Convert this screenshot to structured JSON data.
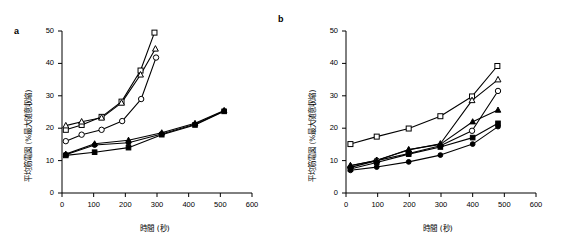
{
  "figure": {
    "panels": [
      {
        "key": "a",
        "label": "a",
        "xlabel": "時間 (秒)",
        "ylabel": "平均筋電図 (%最大随意収縮)"
      },
      {
        "key": "b",
        "label": "b",
        "xlabel": "時間 (秒)",
        "ylabel": "平均筋電図 (%最大随意収縮)"
      }
    ],
    "axis": {
      "xticks": [
        0,
        100,
        200,
        300,
        400,
        500,
        600
      ],
      "yticks": [
        0,
        10,
        20,
        30,
        40,
        50
      ],
      "xlim": [
        0,
        600
      ],
      "ylim": [
        0,
        50
      ]
    },
    "colors": {
      "ink": "#000000",
      "paper": "#ffffff"
    }
  },
  "chart_data": [
    {
      "type": "line",
      "panel": "a",
      "title": "a",
      "xlabel": "時間 (秒)",
      "ylabel": "平均筋電図 (%最大随意収縮)",
      "xlim": [
        0,
        600
      ],
      "ylim": [
        0,
        50
      ],
      "xticks": [
        0,
        100,
        200,
        300,
        400,
        500,
        600
      ],
      "yticks": [
        0,
        10,
        20,
        30,
        40,
        50
      ],
      "grid": false,
      "legend": "none",
      "series": [
        {
          "name": "open-square",
          "marker": "open-square",
          "x": [
            12,
            62,
            125,
            188,
            248,
            292
          ],
          "y": [
            19.5,
            21.0,
            23.5,
            28.2,
            37.8,
            49.5
          ]
        },
        {
          "name": "open-triangle",
          "marker": "open-triangle",
          "x": [
            12,
            62,
            125,
            188,
            248,
            295
          ],
          "y": [
            20.8,
            22.0,
            23.2,
            27.8,
            36.5,
            44.5
          ]
        },
        {
          "name": "open-circle",
          "marker": "open-circle",
          "x": [
            12,
            62,
            125,
            190,
            250,
            297
          ],
          "y": [
            16.0,
            18.0,
            19.5,
            22.2,
            29.0,
            41.8
          ]
        },
        {
          "name": "filled-triangle",
          "marker": "filled-triangle",
          "x": [
            12,
            103,
            210,
            315,
            420,
            512
          ],
          "y": [
            12.0,
            15.2,
            16.3,
            18.6,
            21.5,
            25.5
          ]
        },
        {
          "name": "filled-circle",
          "marker": "filled-circle",
          "x": [
            12,
            103,
            210,
            315,
            420,
            512
          ],
          "y": [
            11.8,
            14.8,
            15.5,
            18.2,
            21.2,
            25.3
          ]
        },
        {
          "name": "filled-square",
          "marker": "filled-square",
          "x": [
            12,
            103,
            210,
            315,
            420,
            512
          ],
          "y": [
            11.6,
            12.6,
            14.0,
            18.0,
            21.0,
            25.2
          ]
        }
      ]
    },
    {
      "type": "line",
      "panel": "b",
      "title": "b",
      "xlabel": "時間 (秒)",
      "ylabel": "平均筋電図 (%最大随意収縮)",
      "xlim": [
        0,
        600
      ],
      "ylim": [
        0,
        50
      ],
      "xticks": [
        0,
        100,
        200,
        300,
        400,
        500,
        600
      ],
      "yticks": [
        0,
        10,
        20,
        30,
        40,
        50
      ],
      "grid": false,
      "legend": "none",
      "series": [
        {
          "name": "open-square",
          "marker": "open-square",
          "x": [
            14,
            97,
            198,
            298,
            398,
            478
          ],
          "y": [
            15.1,
            17.4,
            19.9,
            23.7,
            29.8,
            39.2
          ]
        },
        {
          "name": "open-triangle",
          "marker": "open-triangle",
          "x": [
            14,
            97,
            198,
            298,
            398,
            480
          ],
          "y": [
            8.4,
            10.1,
            13.3,
            15.2,
            28.6,
            35.0
          ]
        },
        {
          "name": "open-circle",
          "marker": "open-circle",
          "x": [
            14,
            97,
            198,
            298,
            398,
            480
          ],
          "y": [
            7.9,
            10.0,
            12.2,
            14.6,
            19.2,
            31.5
          ]
        },
        {
          "name": "filled-triangle",
          "marker": "filled-triangle",
          "x": [
            14,
            97,
            198,
            298,
            400,
            480
          ],
          "y": [
            8.5,
            10.0,
            13.4,
            15.0,
            22.0,
            25.6
          ]
        },
        {
          "name": "filled-square",
          "marker": "filled-square",
          "x": [
            14,
            97,
            198,
            298,
            400,
            480
          ],
          "y": [
            7.4,
            9.4,
            12.0,
            14.2,
            17.1,
            21.5
          ]
        },
        {
          "name": "filled-circle",
          "marker": "filled-circle",
          "x": [
            14,
            97,
            198,
            298,
            400,
            480
          ],
          "y": [
            7.0,
            8.0,
            9.6,
            11.7,
            15.1,
            20.5
          ]
        }
      ]
    }
  ]
}
